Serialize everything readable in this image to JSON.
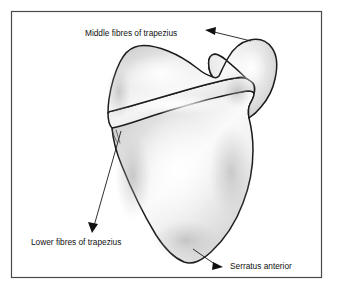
{
  "figure": {
    "background_color": "#ffffff",
    "frame": {
      "color": "#4a4a4a",
      "x": 11,
      "y": 11,
      "width": 311,
      "height": 267
    },
    "bone": {
      "name": "scapula",
      "outline_color": "#1c1c1c",
      "fill_light": "#fbfbfb",
      "fill_mid": "#e0e0e0",
      "fill_dark": "#c2c2c2"
    }
  },
  "labels": [
    {
      "id": "middle-fibres-of-trapezius",
      "text": "Middle fibres of trapezius",
      "x": 85,
      "y": 36,
      "anchor": "start",
      "arrow_direction": "left"
    },
    {
      "id": "lower-fibres-of-trapezius",
      "text": "Lower fibres of trapezius",
      "x": 31,
      "y": 245,
      "anchor": "start",
      "arrow_direction": "down-left"
    },
    {
      "id": "serratus-anterior",
      "text": "Serratus anterior",
      "x": 230,
      "y": 269,
      "anchor": "start",
      "arrow_direction": "right"
    }
  ]
}
